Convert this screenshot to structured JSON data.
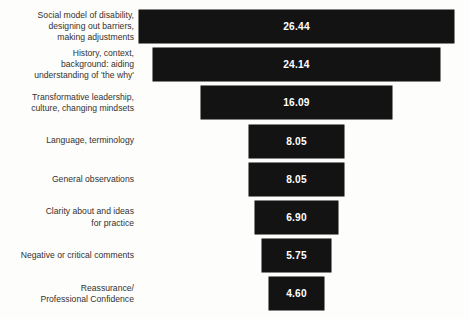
{
  "chart_data": {
    "type": "bar",
    "orientation": "horizontal",
    "layout": "funnel-centered",
    "title": "",
    "subtitle": "",
    "xlabel": "",
    "ylabel": "",
    "grid": false,
    "legend": null,
    "axis_visible": false,
    "tick_labels": [],
    "xlim": [
      0,
      26.44
    ],
    "value_format": "0.00",
    "bar_color": "#131313",
    "value_label_color": "#ffffff",
    "category_label_color": "#33312f",
    "background_color": "#fdfdfb",
    "categories": [
      "Social model of disability,\ndesigning out barriers,\nmaking adjustments",
      "History, context,\nbackground: aiding\nunderstanding of 'the why'",
      "Transformative leadership,\nculture, changing mindsets",
      "Language, terminology",
      "General observations",
      "Clarity about and ideas\nfor practice",
      "Negative or critical comments",
      "Reassurance/\nProfessional Confidence"
    ],
    "values": [
      26.44,
      24.14,
      16.09,
      8.05,
      8.05,
      6.9,
      5.75,
      4.6
    ],
    "value_labels": [
      "26.44",
      "24.14",
      "16.09",
      "8.05",
      "8.05",
      "6.90",
      "5.75",
      "4.60"
    ]
  }
}
